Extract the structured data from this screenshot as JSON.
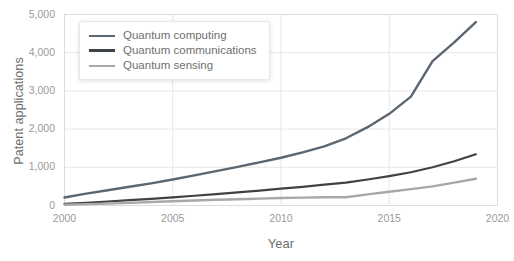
{
  "chart_data": {
    "type": "line",
    "title": "",
    "xlabel": "Year",
    "ylabel": "Patent applications",
    "xlim": [
      2000,
      2020
    ],
    "ylim": [
      0,
      5000
    ],
    "xticks": [
      "2000",
      "2005",
      "2010",
      "2015",
      "2020"
    ],
    "yticks": [
      "0",
      "1,000",
      "2,000",
      "3,000",
      "4,000",
      "5,000"
    ],
    "grid": true,
    "legend_position": "top-left",
    "x": [
      2000,
      2001,
      2002,
      2003,
      2004,
      2005,
      2006,
      2007,
      2008,
      2009,
      2010,
      2011,
      2012,
      2013,
      2014,
      2015,
      2016,
      2017,
      2018,
      2019
    ],
    "series": [
      {
        "name": "Quantum computing",
        "color": "#5b6670",
        "values": [
          210,
          310,
          400,
          490,
          580,
          680,
          790,
          900,
          1010,
          1130,
          1250,
          1390,
          1550,
          1760,
          2050,
          2400,
          2850,
          3780,
          4270,
          4800
        ]
      },
      {
        "name": "Quantum communications",
        "color": "#3d4347",
        "values": [
          40,
          70,
          105,
          140,
          175,
          215,
          255,
          300,
          345,
          390,
          440,
          490,
          545,
          600,
          680,
          770,
          870,
          1000,
          1160,
          1340
        ]
      },
      {
        "name": "Quantum sensing",
        "color": "#a8a8a8",
        "values": [
          20,
          35,
          50,
          70,
          90,
          110,
          130,
          150,
          165,
          180,
          195,
          205,
          215,
          215,
          290,
          360,
          430,
          500,
          600,
          700
        ]
      }
    ]
  },
  "legend": {
    "items": [
      {
        "label": "Quantum computing",
        "color": "#5b6670",
        "width": 2.6
      },
      {
        "label": "Quantum communications",
        "color": "#3d4347",
        "width": 3.0
      },
      {
        "label": "Quantum sensing",
        "color": "#a8a8a8",
        "width": 2.4
      }
    ]
  },
  "axes": {
    "y_title": "Patent applications",
    "x_title": "Year",
    "y_tick_labels": [
      "5,000",
      "4,000",
      "3,000",
      "2,000",
      "1,000",
      "0"
    ],
    "x_tick_labels": [
      "2000",
      "2005",
      "2010",
      "2015",
      "2020"
    ]
  },
  "colors": {
    "grid": "#e6e6e6",
    "plot_border": "#dcdcdc",
    "background": "#ffffff",
    "tick_text": "#9a9a9a",
    "axis_title_text": "#6e6e6e"
  }
}
